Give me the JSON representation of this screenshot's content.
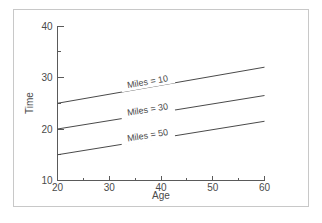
{
  "figure": {
    "frame_color": "#c8c8c8",
    "background": "#ffffff",
    "line_color": "#4a4a4a",
    "axis_color": "#5a5a5a"
  },
  "chart_data": {
    "type": "line",
    "title": "",
    "xlabel": "Age",
    "ylabel": "Time",
    "xlim": [
      20,
      60
    ],
    "ylim": [
      10,
      40
    ],
    "grid": false,
    "legend": "inline-labels",
    "x_ticks_major": [
      20,
      30,
      40,
      50,
      60
    ],
    "x_ticks_major_labels": [
      "20",
      "30",
      "40",
      "50",
      "60"
    ],
    "x_ticks_minor": [
      25,
      35,
      45,
      55
    ],
    "y_ticks_major": [
      10,
      20,
      30,
      40
    ],
    "y_ticks_major_labels": [
      "10",
      "20",
      "30",
      "40"
    ],
    "y_ticks_minor": [
      15,
      25,
      35
    ],
    "x": [
      20,
      60
    ],
    "series": [
      {
        "name": "Miles = 10",
        "values": [
          25.0,
          32.0
        ],
        "label_x": 37.5,
        "label_y": 28.6
      },
      {
        "name": "Miles = 30",
        "values": [
          20.0,
          26.5
        ],
        "label_x": 37.5,
        "label_y": 23.2
      },
      {
        "name": "Miles = 50",
        "values": [
          15.0,
          21.5
        ],
        "label_x": 37.5,
        "label_y": 18.2
      }
    ]
  }
}
